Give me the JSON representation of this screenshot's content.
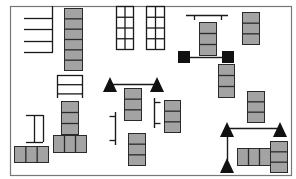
{
  "diagram": {
    "type": "floor-plan",
    "colors": {
      "background": "#ffffff",
      "border": "#777777",
      "stroke": "#1a1a1a",
      "block_fill": "#a3a3a3",
      "block_stroke": "#2a2a2a",
      "solid": "#111111"
    },
    "border": {
      "x": 10,
      "y": 6,
      "w": 281,
      "h": 169
    },
    "stacks": [
      {
        "id": "stack-top-left-column",
        "x": 64,
        "y": 8,
        "w": 18,
        "h": 62,
        "cells": 6,
        "dir": "v"
      },
      {
        "id": "stack-center-top",
        "x": 199,
        "y": 22,
        "w": 17,
        "h": 33,
        "cells": 3,
        "dir": "v"
      },
      {
        "id": "stack-top-right",
        "x": 242,
        "y": 12,
        "w": 17,
        "h": 32,
        "cells": 3,
        "dir": "v"
      },
      {
        "id": "stack-right-mid-upper",
        "x": 218,
        "y": 64,
        "w": 16,
        "h": 33,
        "cells": 3,
        "dir": "v"
      },
      {
        "id": "stack-center-under-bar",
        "x": 124,
        "y": 88,
        "w": 17,
        "h": 32,
        "cells": 3,
        "dir": "v"
      },
      {
        "id": "stack-center-right",
        "x": 164,
        "y": 100,
        "w": 16,
        "h": 32,
        "cells": 3,
        "dir": "v"
      },
      {
        "id": "stack-center-bottom",
        "x": 128,
        "y": 133,
        "w": 17,
        "h": 32,
        "cells": 3,
        "dir": "v"
      },
      {
        "id": "stack-right-mid",
        "x": 247,
        "y": 91,
        "w": 17,
        "h": 31,
        "cells": 3,
        "dir": "v"
      },
      {
        "id": "stack-bottom-right-vertical",
        "x": 270,
        "y": 141,
        "w": 17,
        "h": 31,
        "cells": 3,
        "dir": "v"
      },
      {
        "id": "stack-bottom-right-horizontal",
        "x": 237,
        "y": 148,
        "w": 33,
        "h": 17,
        "cells": 3,
        "dir": "h"
      },
      {
        "id": "stack-bottom-left-horizontal",
        "x": 14,
        "y": 146,
        "w": 34,
        "h": 16,
        "cells": 3,
        "dir": "h"
      },
      {
        "id": "stack-left-center-vertical",
        "x": 61,
        "y": 101,
        "w": 17,
        "h": 33,
        "cells": 3,
        "dir": "v"
      },
      {
        "id": "stack-left-center-horizontal",
        "x": 53,
        "y": 135,
        "w": 33,
        "h": 17,
        "cells": 3,
        "dir": "h"
      }
    ],
    "grid_racks": [
      {
        "id": "grid-rack-1",
        "x": 116,
        "y": 6,
        "w": 17,
        "h": 43,
        "cols": 2,
        "rows": 4
      },
      {
        "id": "grid-rack-2",
        "x": 146,
        "y": 6,
        "w": 18,
        "h": 43,
        "cols": 2,
        "rows": 4
      }
    ],
    "ladder_rack": {
      "id": "ladder-rack",
      "x": 57,
      "y": 75,
      "w": 25,
      "h": 23,
      "rows": 3
    },
    "comb_rack": {
      "id": "comb-rack-top-left",
      "spine_x": 52,
      "y1": 6,
      "y2": 52,
      "bar_x1": 24,
      "bars_y": [
        18,
        29,
        41,
        52
      ]
    },
    "i_bracket": {
      "id": "i-bracket-bottom-left",
      "x1": 26,
      "x2": 43,
      "y1": 115,
      "y2": 142
    },
    "side_brackets": [
      {
        "id": "side-bracket-left",
        "x": 115,
        "y1": 112,
        "y2": 145,
        "tick": -6
      },
      {
        "id": "side-bracket-right",
        "x": 154,
        "y1": 98,
        "y2": 128,
        "tick": 6
      }
    ],
    "t_bar": {
      "id": "t-bar-top",
      "x1": 186,
      "x2": 228,
      "y": 15,
      "ticks_x": [
        194,
        221
      ],
      "tick_len": 5
    },
    "barbell_squares": {
      "id": "barbell-with-plates",
      "left": {
        "x": 178,
        "y": 51,
        "s": 12
      },
      "right": {
        "x": 222,
        "y": 51,
        "s": 12
      },
      "bar_y": 57
    },
    "triangle_bars": [
      {
        "id": "triangle-bar-center",
        "triangles": [
          [
            110,
            77
          ],
          [
            157,
            77
          ]
        ],
        "bar": {
          "x1": 110,
          "x2": 157,
          "y": 84
        }
      },
      {
        "id": "triangle-bar-right",
        "triangles": [
          [
            227,
            122
          ],
          [
            280,
            122
          ],
          [
            227,
            158
          ]
        ],
        "bar": {
          "x1": 227,
          "x2": 280,
          "y": 128
        },
        "vline": {
          "x": 227,
          "y1": 128,
          "y2": 160
        }
      }
    ],
    "triangle_size": {
      "w": 14,
      "h": 15
    }
  }
}
